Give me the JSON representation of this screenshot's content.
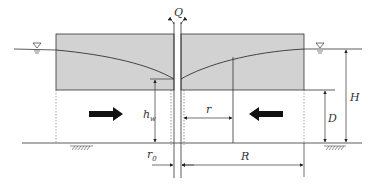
{
  "diagram": {
    "type": "confined-aquifer-well-section",
    "colors": {
      "aquifer_fill": "#d2d2d2",
      "line": "#333333",
      "arrow": "#111111",
      "background": "#ffffff"
    },
    "labels": {
      "discharge": "Q",
      "well_head": "h",
      "well_head_sub": "w",
      "radius": "r",
      "well_radius": "r",
      "well_radius_sub": "0",
      "influence_radius": "R",
      "aquifer_thickness": "D",
      "total_head": "H"
    },
    "symbols": {
      "water_table_left": "water-level-triangle",
      "water_table_right": "water-level-triangle",
      "ground_hatch_left": "ground-hatch",
      "ground_hatch_right": "ground-hatch"
    },
    "flow_arrows": [
      "right",
      "left"
    ]
  }
}
